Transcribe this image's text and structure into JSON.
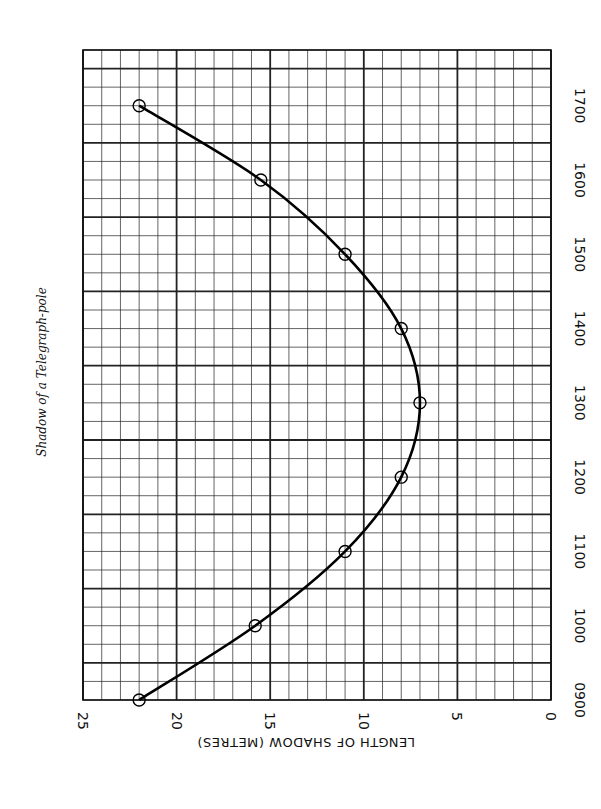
{
  "chart_data": {
    "type": "line",
    "title": "Shadow of a Telegraph-pole",
    "orientation": "rotated 90° clockwise (time axis vertical on right, length axis horizontal along bottom, reversed)",
    "xlabel": "Time of day",
    "ylabel": "LENGTH OF SHADOW (METRES)",
    "x": [
      "0900",
      "1000",
      "1100",
      "1200",
      "1300",
      "1400",
      "1500",
      "1600",
      "1700"
    ],
    "x_hours": [
      9,
      10,
      11,
      12,
      13,
      14,
      15,
      16,
      17
    ],
    "series": [
      {
        "name": "Shadow length",
        "values": [
          22,
          15.8,
          11,
          8,
          7,
          8,
          11,
          15.5,
          22
        ],
        "markers": "open-circle",
        "smooth": true
      }
    ],
    "time_tick_labels": [
      "0900",
      "1000",
      "1100",
      "1200",
      "1300",
      "1400",
      "1500",
      "1600",
      "1700"
    ],
    "length_tick_labels": [
      "25",
      "20",
      "15",
      "10",
      "5",
      "0"
    ],
    "length_ticks": [
      25,
      20,
      15,
      10,
      5,
      0
    ],
    "xlim": [
      9,
      17.75
    ],
    "ylim": [
      0,
      25
    ],
    "grid": true,
    "grid_minor": {
      "length_step": 1,
      "time_step_minutes": 15
    },
    "legend": null
  }
}
